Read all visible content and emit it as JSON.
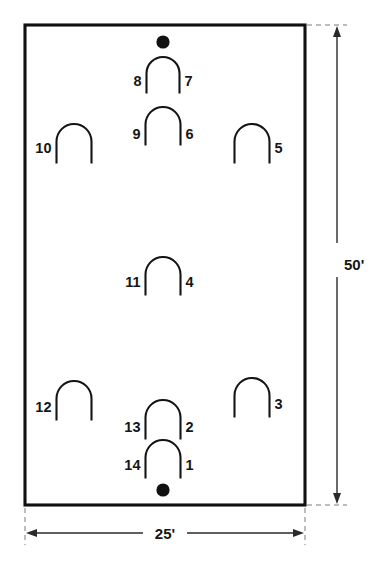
{
  "diagram": {
    "court": {
      "x": 25,
      "y": 25,
      "width": 280,
      "height": 480,
      "fill": "#ffffff",
      "stroke": "#111111"
    },
    "dimensions": {
      "width_label": "25'",
      "height_label": "50'",
      "line_color": "#2a2a2a",
      "extension_color": "#7a7a7a"
    },
    "dots": [
      {
        "name": "top-center-dot",
        "cx": 163,
        "cy": 42,
        "r": 6.6
      },
      {
        "name": "bottom-center-dot",
        "cx": 163,
        "cy": 490,
        "r": 6.6
      }
    ],
    "arch_color": "#141414",
    "arches": [
      {
        "id": "arch-8-7",
        "cx": 163,
        "top": 57,
        "rx": 16.5,
        "leg": 20,
        "left_label": "8",
        "right_label": "7",
        "label_y": 86
      },
      {
        "id": "arch-9-6",
        "cx": 163,
        "top": 107,
        "rx": 17.5,
        "leg": 21,
        "left_label": "9",
        "right_label": "6",
        "label_y": 139
      },
      {
        "id": "arch-10",
        "cx": 74,
        "top": 124,
        "rx": 17.5,
        "leg": 22,
        "left_label": "10",
        "right_label": "",
        "label_y": 153
      },
      {
        "id": "arch-5",
        "cx": 252,
        "top": 124,
        "rx": 17.5,
        "leg": 22,
        "left_label": "",
        "right_label": "5",
        "label_y": 153
      },
      {
        "id": "arch-11-4",
        "cx": 163,
        "top": 257,
        "rx": 17.5,
        "leg": 21,
        "left_label": "11",
        "right_label": "4",
        "label_y": 287
      },
      {
        "id": "arch-12",
        "cx": 74,
        "top": 381,
        "rx": 17.5,
        "leg": 22,
        "left_label": "12",
        "right_label": "",
        "label_y": 412
      },
      {
        "id": "arch-3",
        "cx": 252,
        "top": 378,
        "rx": 17.5,
        "leg": 22,
        "left_label": "",
        "right_label": "3",
        "label_y": 409
      },
      {
        "id": "arch-13-2",
        "cx": 163,
        "top": 400,
        "rx": 17.5,
        "leg": 22,
        "left_label": "13",
        "right_label": "2",
        "label_y": 432
      },
      {
        "id": "arch-14-1",
        "cx": 163,
        "top": 440,
        "rx": 17.5,
        "leg": 21,
        "left_label": "14",
        "right_label": "1",
        "label_y": 470
      }
    ],
    "station_numbers": [
      "1",
      "2",
      "3",
      "4",
      "5",
      "6",
      "7",
      "8",
      "9",
      "10",
      "11",
      "12",
      "13",
      "14"
    ],
    "bleed_text_lines": [
      {
        "text": "the mark of the object appears to have",
        "x": 36,
        "y": 30
      },
      {
        "text": "been traced and was not available",
        "x": 36,
        "y": 52
      },
      {
        "text": "within these conditions with a",
        "x": 36,
        "y": 74
      }
    ]
  }
}
